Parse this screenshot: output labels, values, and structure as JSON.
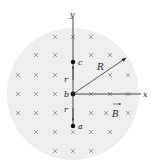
{
  "diagram": {
    "field_region": {
      "fill": "#eeeeee",
      "radius_label": "R"
    },
    "axes": {
      "x_label": "x",
      "y_label": "y"
    },
    "points": [
      {
        "id": "c",
        "label": "c"
      },
      {
        "id": "b",
        "label": "b"
      },
      {
        "id": "a",
        "label": "a"
      }
    ],
    "distance_labels": {
      "upper": "r",
      "lower": "r"
    },
    "field_label": "B",
    "field_direction": "into-page-cross-icon",
    "colors": {
      "region": "#eeeeee",
      "axis": "#333333",
      "cross": "#9a9a9a",
      "point": "#111111"
    }
  }
}
